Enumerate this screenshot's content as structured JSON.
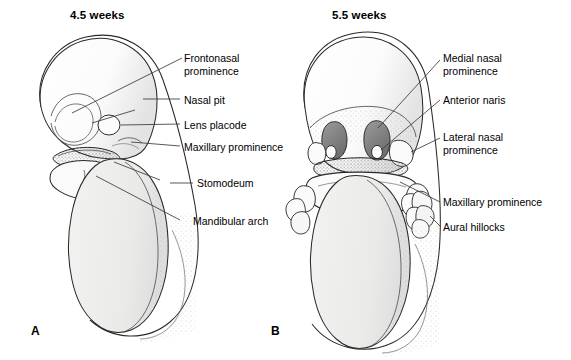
{
  "figure": {
    "caption_letters": {
      "a": "A",
      "b": "B"
    }
  },
  "panels": [
    {
      "id": "a",
      "title": "4.5 weeks",
      "letter": "A",
      "view": "lateral view of embryo head and trunk"
    },
    {
      "id": "b",
      "title": "5.5 weeks",
      "letter": "B",
      "view": "frontal view of embryo head and trunk"
    }
  ],
  "labels_left_panel": [
    {
      "name": "frontonasal-prominence",
      "text": "Frontonasal\nprominence",
      "x": 184,
      "y": 52
    },
    {
      "name": "nasal-pit",
      "text": "Nasal pit",
      "x": 184,
      "y": 94
    },
    {
      "name": "lens-placode",
      "text": "Lens placode",
      "x": 184,
      "y": 119
    },
    {
      "name": "maxillary-prominence",
      "text": "Maxillary prominence",
      "x": 184,
      "y": 141
    },
    {
      "name": "stomodeum",
      "text": "Stomodeum",
      "x": 197,
      "y": 178
    },
    {
      "name": "mandibular-arch",
      "text": "Mandibular arch",
      "x": 193,
      "y": 216
    }
  ],
  "labels_right_panel": [
    {
      "name": "medial-nasal-prominence",
      "text": "Medial nasal\nprominence",
      "x": 443,
      "y": 52
    },
    {
      "name": "anterior-naris",
      "text": "Anterior naris",
      "x": 443,
      "y": 94
    },
    {
      "name": "lateral-nasal-prominence",
      "text": "Lateral nasal\nprominence",
      "x": 443,
      "y": 131
    },
    {
      "name": "maxillary-prominence-b",
      "text": "Maxillary prominence",
      "x": 443,
      "y": 196
    },
    {
      "name": "aural-hillocks",
      "text": "Aural hillocks",
      "x": 443,
      "y": 222
    }
  ],
  "colors": {
    "background": "#ffffff",
    "ink": "#1a1a1a",
    "leader_line": "#333333",
    "body_fill": "#ececeb",
    "head_fill": "#fdfdfd",
    "dark_structure": "#8e8e8e",
    "stomodeum_fill": "#6f6f6f",
    "stipple": "#9a9a9a"
  }
}
